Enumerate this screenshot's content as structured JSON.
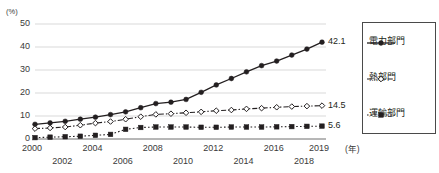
{
  "chart_data": {
    "type": "line",
    "title": "",
    "xlabel": "(年)",
    "ylabel": "(%)",
    "ylim": [
      0,
      50
    ],
    "yticks": [
      0,
      10,
      20,
      30,
      40,
      50
    ],
    "xlim": [
      2000,
      2019
    ],
    "grid": true,
    "legend_position": "right",
    "x": [
      2000,
      2001,
      2002,
      2003,
      2004,
      2005,
      2006,
      2007,
      2008,
      2009,
      2010,
      2011,
      2012,
      2013,
      2014,
      2015,
      2016,
      2017,
      2018,
      2019
    ],
    "xtick_labels_top": [
      "2000",
      "2004",
      "2008",
      "2012",
      "2016",
      "2019"
    ],
    "xtick_labels_bottom": [
      "2002",
      "2006",
      "2010",
      "2014",
      "2018"
    ],
    "series": [
      {
        "name": "電力部門",
        "style": "solid",
        "marker": "filled-circle",
        "color": "#231f20",
        "end_label": "42.1",
        "values": [
          6.4,
          7.0,
          7.7,
          8.6,
          9.5,
          10.6,
          11.8,
          13.6,
          15.4,
          16.0,
          17.2,
          20.3,
          23.5,
          26.3,
          29.2,
          31.9,
          33.9,
          36.5,
          39.1,
          42.1
        ]
      },
      {
        "name": "熱部門",
        "style": "dash-dot",
        "marker": "open-diamond",
        "color": "#231f20",
        "end_label": "14.5",
        "values": [
          4.5,
          4.8,
          5.2,
          6.0,
          6.9,
          7.6,
          8.6,
          9.7,
          10.7,
          11.0,
          11.4,
          11.8,
          12.3,
          12.6,
          13.1,
          13.4,
          13.8,
          14.1,
          14.3,
          14.5
        ]
      },
      {
        "name": "運輸部門",
        "style": "dotted",
        "marker": "filled-square",
        "color": "#231f20",
        "end_label": "5.6",
        "values": [
          0.6,
          0.8,
          1.0,
          1.2,
          1.6,
          2.0,
          4.2,
          5.0,
          5.2,
          5.2,
          5.2,
          5.1,
          5.1,
          5.2,
          5.2,
          5.2,
          5.3,
          5.4,
          5.5,
          5.6
        ]
      }
    ]
  },
  "axis": {
    "y_unit": "(%)",
    "x_unit": "(年)"
  },
  "legend": {
    "items": [
      {
        "label": "電力部門"
      },
      {
        "label": "熱部門"
      },
      {
        "label": "運輸部門"
      }
    ]
  }
}
